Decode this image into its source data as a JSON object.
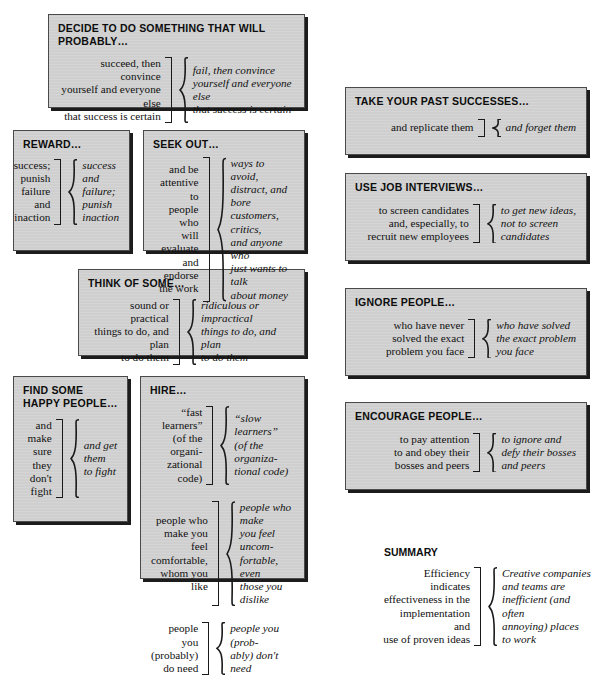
{
  "document": {
    "kind": "diagram",
    "title": "Creative vs. Efficient Organization Comparison Chart"
  },
  "panels": [
    {
      "id": "decide",
      "title": "DECIDE TO DO SOMETHING THAT WILL PROBABLY…",
      "rows": [
        {
          "left": "succeed, then convince\nyourself and everyone else\nthat success is certain",
          "right": "fail, then convince\nyourself and everyone else\nthat success is certain"
        }
      ]
    },
    {
      "id": "reward",
      "title": "REWARD…",
      "rows": [
        {
          "left": "success;\npunish\nfailure and\ninaction",
          "right": "success\nand\nfailure;\npunish\ninaction"
        }
      ]
    },
    {
      "id": "seek-out",
      "title": "SEEK OUT…",
      "rows": [
        {
          "left": "and be\nattentive to\npeople who\nwill evaluate\nand endorse\nthe work",
          "right": "ways to avoid,\ndistract, and bore\ncustomers, critics,\nand anyone who\njust wants to talk\nabout money"
        }
      ]
    },
    {
      "id": "think-of-some",
      "title": "THINK OF SOME…",
      "rows": [
        {
          "left": "sound or practical\nthings to do, and plan\nto do them",
          "right": "ridiculous or impractical\nthings to do, and plan\nto do them"
        }
      ]
    },
    {
      "id": "find-some-happy-people",
      "title": "FIND SOME\nHAPPY PEOPLE…",
      "rows": [
        {
          "left": "and\nmake\nsure\nthey\ndon't\nfight",
          "right": "and get\nthem\nto fight"
        }
      ]
    },
    {
      "id": "hire",
      "title": "HIRE…",
      "rows": [
        {
          "left": "“fast learners”\n(of the organi-\nzational code)",
          "right": "“slow learners”\n(of the organiza-\ntional code)"
        },
        {
          "left": "people who\nmake you feel\ncomfortable,\nwhom you like",
          "right": "people who make\nyou feel uncom-\nfortable, even\nthose you dislike"
        },
        {
          "left": "people you\n(probably)\ndo need",
          "right": "people you (prob-\nably) don't need"
        }
      ]
    },
    {
      "id": "take-your-past-successes",
      "title": "TAKE YOUR PAST SUCCESSES…",
      "rows": [
        {
          "left": "and replicate them",
          "right": "and forget them"
        }
      ]
    },
    {
      "id": "use-job-interviews",
      "title": "USE JOB INTERVIEWS…",
      "rows": [
        {
          "left": "to screen candidates\nand, especially, to\nrecruit new employees",
          "right": "to get new ideas,\nnot to screen\ncandidates"
        }
      ]
    },
    {
      "id": "ignore-people",
      "title": "IGNORE PEOPLE…",
      "rows": [
        {
          "left": "who have never\nsolved the exact\nproblem you face",
          "right": "who have solved\nthe exact problem\nyou face"
        }
      ]
    },
    {
      "id": "encourage-people",
      "title": "ENCOURAGE PEOPLE…",
      "rows": [
        {
          "left": "to pay attention\nto and obey their\nbosses and peers",
          "right": "to ignore and\ndefy their bosses\nand peers"
        }
      ]
    }
  ],
  "summary": {
    "title": "SUMMARY",
    "left": "Efficiency indicates\neffectiveness in the\nimplementation and\nuse of proven ideas",
    "right": "Creative companies\nand teams are\ninefficient (and often\nannoying) places\nto work"
  },
  "colors": {
    "panel_fill": "#d3d3d3",
    "panel_border": "#4a4a4a",
    "panel_shadow": "#1c1c1c",
    "page_background": "#ffffff",
    "text": "#111111"
  }
}
